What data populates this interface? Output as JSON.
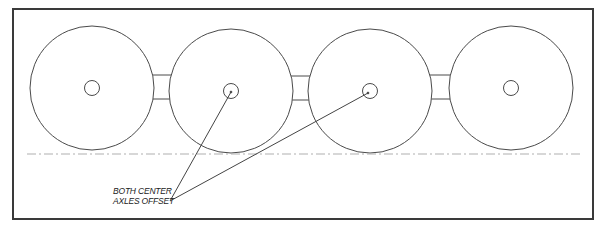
{
  "diagram": {
    "colors": {
      "frame": "#3a3a3a",
      "wheel": "#4a4a4a",
      "centerline": "#b0b0b0",
      "leader": "#444444"
    },
    "frame": {
      "x": 13,
      "y": 9,
      "width": 580,
      "height": 210
    },
    "wheels": [
      {
        "name": "wheel-1",
        "cx": 92,
        "cy": 88,
        "r": 62,
        "hub_r": 7.5,
        "offset": false
      },
      {
        "name": "wheel-2",
        "cx": 231,
        "cy": 91,
        "r": 62,
        "hub_r": 7.5,
        "offset": true
      },
      {
        "name": "wheel-3",
        "cx": 370,
        "cy": 91,
        "r": 62,
        "hub_r": 7.5,
        "offset": true
      },
      {
        "name": "wheel-4",
        "cx": 511,
        "cy": 88,
        "r": 62,
        "hub_r": 7.5,
        "offset": false
      }
    ],
    "centerline": {
      "y": 154,
      "x1": 27,
      "x2": 583,
      "style": "dash-dot"
    },
    "callout": {
      "line1": "BOTH CENTER",
      "line2": "AXLES OFFSET",
      "origin": {
        "x": 170,
        "y": 201
      },
      "targets": [
        {
          "x": 231,
          "y": 92
        },
        {
          "x": 368,
          "y": 93
        }
      ]
    }
  }
}
